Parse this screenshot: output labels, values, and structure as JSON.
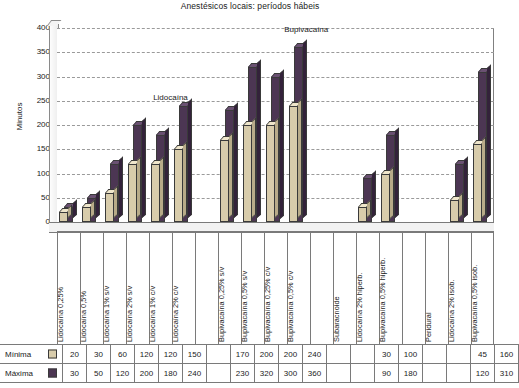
{
  "chart_data": {
    "type": "bar",
    "title": "Anestésicos locais: períodos hábeis",
    "xlabel": "",
    "ylabel": "Minutos",
    "ylim": [
      0,
      400
    ],
    "yticks": [
      400,
      350,
      300,
      250,
      200,
      150,
      100,
      50,
      0
    ],
    "grid": true,
    "legend_position": "table-left",
    "annotations": [
      {
        "text": "Lidocaína",
        "x_frac": 0.22,
        "y_value": 245
      },
      {
        "text": "Bupivacaína",
        "x_frac": 0.52,
        "y_value": 385
      }
    ],
    "categories": [
      "Lidocaína 0,25%",
      "Lidocaína 0,5%",
      "Lidocaína 1% s/v",
      "Lidocaína 2% s/v",
      "Lidocaína 1% c/v",
      "Lidocaína 2% c/v",
      "",
      "Bupivacaína 0,25% s/v",
      "Bupivacaína 0,5% s/v",
      "Bupivacaína 0,25% c/v",
      "Bupivacaína 0,5% c/v",
      "",
      "Subaracnoide",
      "Lidocaína 2% hiperb.",
      "Bupivacaína 0,5% hiperb.",
      "",
      "Peridural",
      "Lidocaína 2% isob.",
      "Bupivacaína 0,5% isob."
    ],
    "series": [
      {
        "name": "Mínima",
        "color": "#d8ccab",
        "values": [
          20,
          30,
          60,
          120,
          120,
          150,
          null,
          170,
          200,
          200,
          240,
          null,
          null,
          30,
          100,
          null,
          null,
          45,
          160
        ]
      },
      {
        "name": "Máxima",
        "color": "#4c3653",
        "values": [
          30,
          50,
          120,
          200,
          180,
          240,
          null,
          230,
          320,
          300,
          360,
          null,
          null,
          90,
          180,
          null,
          null,
          120,
          310
        ]
      }
    ]
  },
  "table": {
    "rows": [
      {
        "label": "Mínima",
        "swatch": "min-swatch",
        "cells": [
          "20",
          "30",
          "60",
          "120",
          "120",
          "150",
          "",
          "170",
          "200",
          "200",
          "240",
          "",
          "",
          "30",
          "100",
          "",
          "",
          "45",
          "160"
        ]
      },
      {
        "label": "Máxima",
        "swatch": "max-swatch",
        "cells": [
          "30",
          "50",
          "120",
          "200",
          "180",
          "240",
          "",
          "230",
          "320",
          "300",
          "360",
          "",
          "",
          "90",
          "180",
          "",
          "",
          "120",
          "310"
        ]
      }
    ]
  },
  "colors": {
    "minima": "#d8ccab",
    "maxima": "#4c3653",
    "grid": "#9a9a9a",
    "axis": "#7a7a7a"
  }
}
